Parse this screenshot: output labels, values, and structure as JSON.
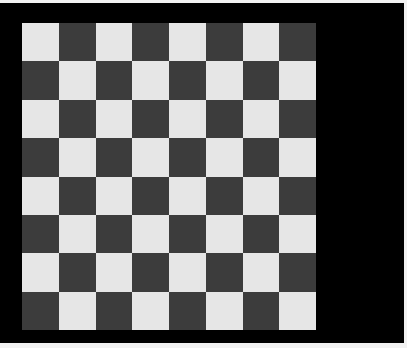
{
  "board": {
    "rows": 8,
    "cols": 8,
    "top_left_color": "light",
    "colors": {
      "light": "#e6e6e6",
      "dark": "#3c3c3c",
      "background": "#000000",
      "border": "#f2f2f2"
    },
    "pieces": []
  }
}
